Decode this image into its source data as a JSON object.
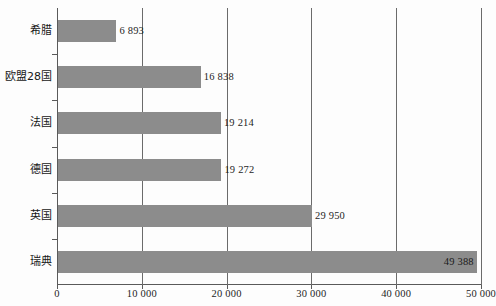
{
  "chart_data": {
    "type": "bar",
    "orientation": "horizontal",
    "title": "",
    "subtitle": "",
    "xlabel": "",
    "ylabel": "",
    "categories": [
      "希腊",
      "欧盟28国",
      "法国",
      "德国",
      "英国",
      "瑞典"
    ],
    "values": [
      6893,
      16838,
      19214,
      19272,
      29950,
      49388
    ],
    "value_labels": [
      "6 893",
      "16 838",
      "19 214",
      "19 272",
      "29 950",
      "49 388"
    ],
    "series": [
      {
        "name": "",
        "values": [
          6893,
          16838,
          19214,
          19272,
          29950,
          49388
        ]
      }
    ],
    "xlim": [
      0,
      50000
    ],
    "xticks": [
      0,
      10000,
      20000,
      30000,
      40000,
      50000
    ],
    "xtick_labels": [
      "0",
      "10 000",
      "20 000",
      "30 000",
      "40 000",
      "50 000"
    ],
    "grid": "vertical",
    "legend": "none",
    "bar_color": "#8c8c8c",
    "axis_color": "#5a5a5a",
    "gridline_color": "#6b6b6b",
    "background_color": "#fdfdfd",
    "text_color": "#1d1d1d"
  }
}
